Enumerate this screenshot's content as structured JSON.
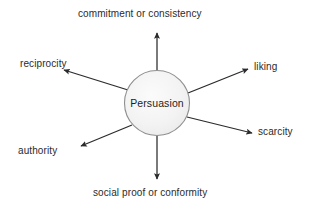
{
  "diagram": {
    "type": "radial-hub-and-spoke",
    "background_color": "#ffffff",
    "line_color": "#2b2b2b",
    "text_color": "#2b2b2b",
    "hub": {
      "label": "Persuasion",
      "shape": "circle",
      "fill_color": "#f2f2f2",
      "stroke_color": "#8c8c8c",
      "center_x": 157,
      "center_y": 103,
      "radius": 33
    },
    "spokes": [
      {
        "id": "commitment",
        "label": "commitment or consistency",
        "direction": "up",
        "angle_deg": 90,
        "arrow_from": [
          157,
          70
        ],
        "arrow_to": [
          157,
          32
        ]
      },
      {
        "id": "liking",
        "label": "liking",
        "direction": "upper-right",
        "angle_deg": 18,
        "arrow_from": [
          188,
          93
        ],
        "arrow_to": [
          249,
          69
        ]
      },
      {
        "id": "scarcity",
        "label": "scarcity",
        "direction": "right",
        "angle_deg": -13,
        "arrow_from": [
          187,
          117
        ],
        "arrow_to": [
          253,
          133
        ]
      },
      {
        "id": "social-proof",
        "label": "social proof or conformity",
        "direction": "down",
        "angle_deg": -90,
        "arrow_from": [
          157,
          136
        ],
        "arrow_to": [
          157,
          180
        ]
      },
      {
        "id": "authority",
        "label": "authority",
        "direction": "lower-left",
        "angle_deg": -163,
        "arrow_from": [
          131,
          125
        ],
        "arrow_to": [
          80,
          146
        ]
      },
      {
        "id": "reciprocity",
        "label": "reciprocity",
        "direction": "upper-left",
        "angle_deg": 160,
        "arrow_from": [
          128,
          90
        ],
        "arrow_to": [
          63,
          70
        ]
      }
    ]
  }
}
